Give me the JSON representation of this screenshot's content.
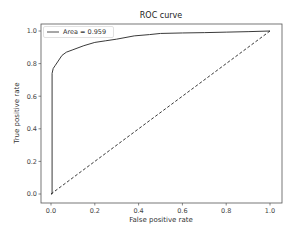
{
  "chart_data": {
    "type": "line",
    "title": "ROC curve",
    "xlabel": "False positive rate",
    "ylabel": "True positive rate",
    "xlim": [
      -0.05,
      1.05
    ],
    "ylim": [
      -0.05,
      1.05
    ],
    "x_ticks": [
      "0.0",
      "0.2",
      "0.4",
      "0.6",
      "0.8",
      "1.0"
    ],
    "y_ticks": [
      "0.0",
      "0.2",
      "0.4",
      "0.6",
      "0.8",
      "1.0"
    ],
    "grid": false,
    "legend_position": "upper left",
    "series": [
      {
        "name": "Area = 0.959",
        "style": "solid",
        "color": "#3a3a3a",
        "x": [
          0.0,
          0.005,
          0.005,
          0.01,
          0.02,
          0.03,
          0.05,
          0.07,
          0.1,
          0.15,
          0.2,
          0.25,
          0.3,
          0.38,
          0.45,
          0.5,
          0.6,
          0.7,
          0.8,
          0.9,
          1.0
        ],
        "y": [
          0.0,
          0.0,
          0.74,
          0.77,
          0.79,
          0.81,
          0.85,
          0.87,
          0.885,
          0.91,
          0.93,
          0.94,
          0.95,
          0.97,
          0.978,
          0.985,
          0.988,
          0.99,
          0.993,
          0.996,
          1.0
        ]
      },
      {
        "name": "random",
        "style": "dashed",
        "color": "#222222",
        "x": [
          0.0,
          1.0
        ],
        "y": [
          0.0,
          1.0
        ]
      }
    ],
    "annotations": []
  },
  "legend": {
    "label": "Area = 0.959"
  }
}
